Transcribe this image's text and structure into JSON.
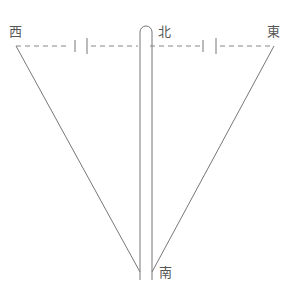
{
  "diagram": {
    "labels": {
      "west": "西",
      "north": "北",
      "east": "東",
      "south": "南"
    },
    "colors": {
      "line": "#777777",
      "text": "#555555",
      "background": "#ffffff"
    }
  }
}
